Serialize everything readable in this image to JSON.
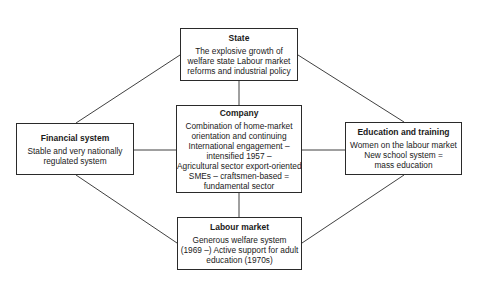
{
  "diagram": {
    "nodes": [
      {
        "id": "state",
        "title": "State",
        "lines": [
          "The explosive growth of",
          "welfare state Labour market",
          "reforms and industrial policy"
        ]
      },
      {
        "id": "company",
        "title": "Company",
        "lines": [
          "Combination of home-market",
          "orientation and continuing",
          "International engagement –",
          "intensified 1957 –",
          "Agricultural sector export-oriented",
          "SMEs – craftsmen-based =",
          "fundamental sector"
        ]
      },
      {
        "id": "financial",
        "title": "Financial system",
        "lines": [
          "Stable and very nationally",
          "regulated system"
        ]
      },
      {
        "id": "education",
        "title": "Education and training",
        "lines": [
          "Women on the labour market",
          "New school system =",
          "mass education"
        ]
      },
      {
        "id": "labour",
        "title": "Labour market",
        "lines": [
          "Generous welfare system",
          "(1969 –) Active support for adult",
          "education (1970s)"
        ]
      }
    ],
    "edges": [
      [
        "state",
        "company"
      ],
      [
        "company",
        "labour"
      ],
      [
        "financial",
        "company"
      ],
      [
        "company",
        "education"
      ],
      [
        "financial",
        "state"
      ],
      [
        "state",
        "education"
      ],
      [
        "financial",
        "labour"
      ],
      [
        "education",
        "labour"
      ]
    ]
  }
}
